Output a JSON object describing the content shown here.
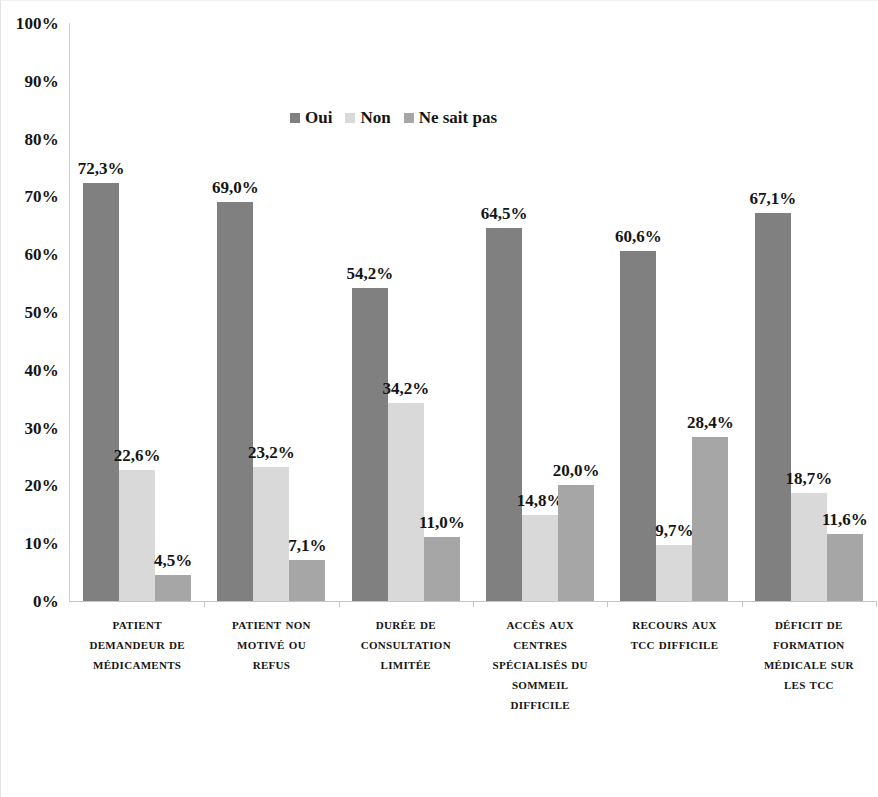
{
  "chart_data": {
    "type": "bar",
    "title": "",
    "subtitle": "",
    "xlabel": "",
    "ylabel": "",
    "ylim": [
      0,
      100
    ],
    "ytick_labels": [
      "100%",
      "90%",
      "80%",
      "70%",
      "60%",
      "50%",
      "40%",
      "30%",
      "20%",
      "10%",
      "0%"
    ],
    "ytick_values": [
      100,
      90,
      80,
      70,
      60,
      50,
      40,
      30,
      20,
      10,
      0
    ],
    "grid": false,
    "legend_position": "top-center",
    "value_format": "comma-decimal-percent",
    "categories": [
      "Patient demandeur de médicaments",
      "Patient non motivé ou refus",
      "Durée de consultation limitée",
      "Accès aux centres spécialisés du sommeil difficile",
      "Recours aux TCC difficile",
      "Déficit de formation médicale sur les TCC"
    ],
    "category_label_lines": [
      [
        "Patient",
        "demandeur de",
        "médicaments"
      ],
      [
        "Patient non",
        "motivé ou",
        "refus"
      ],
      [
        "Durée de",
        "consultation",
        "limitée"
      ],
      [
        "Accès aux",
        "centres",
        "spécialisés du",
        "sommeil",
        "difficile"
      ],
      [
        "Recours aux",
        "TCC difficile"
      ],
      [
        "Déficit de",
        "formation",
        "médicale sur",
        "les TCC"
      ]
    ],
    "series": [
      {
        "name": "Oui",
        "color": "#808080",
        "values": [
          72.3,
          69.0,
          54.2,
          64.5,
          60.6,
          67.1
        ],
        "labels": [
          "72,3%",
          "69,0%",
          "54,2%",
          "64,5%",
          "60,6%",
          "67,1%"
        ]
      },
      {
        "name": "Non",
        "color": "#d9d9d9",
        "values": [
          22.6,
          23.2,
          34.2,
          14.8,
          9.7,
          18.7
        ],
        "labels": [
          "22,6%",
          "23,2%",
          "34,2%",
          "14,8%",
          "9,7%",
          "18,7%"
        ]
      },
      {
        "name": "Ne sait pas",
        "color": "#a6a6a6",
        "values": [
          4.5,
          7.1,
          11.0,
          20.0,
          28.4,
          11.6
        ],
        "labels": [
          "4,5%",
          "7,1%",
          "11,0%",
          "20,0%",
          "28,4%",
          "11,6%"
        ]
      }
    ]
  },
  "legend": {
    "items": [
      {
        "label": "Oui",
        "color": "#808080",
        "icon": "legend-swatch-icon"
      },
      {
        "label": "Non",
        "color": "#d9d9d9",
        "icon": "legend-swatch-icon"
      },
      {
        "label": "Ne sait pas",
        "color": "#a6a6a6",
        "icon": "legend-swatch-icon"
      }
    ]
  },
  "axes": {
    "axis_line_color": "#c4c4c4",
    "y_axis_color": "#d0d0d0"
  }
}
